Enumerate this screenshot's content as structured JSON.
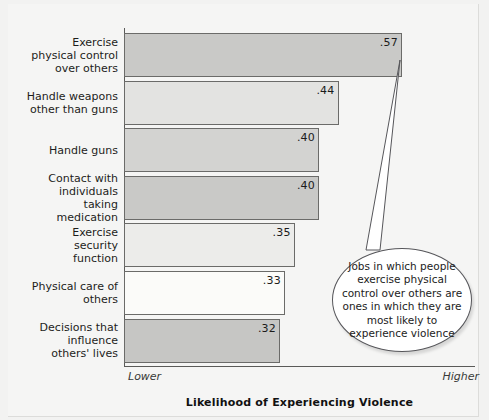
{
  "chart_data": {
    "type": "bar",
    "orientation": "horizontal",
    "title": "",
    "xlabel": "Likelihood of Experiencing Violence",
    "ylabel": "Characteristics of Jobs",
    "categories": [
      "Exercise physical control over others",
      "Handle weapons other than guns",
      "Handle guns",
      "Contact with individuals taking medication",
      "Exercise security function",
      "Physical care of others",
      "Decisions that influence others' lives"
    ],
    "values": [
      0.57,
      0.44,
      0.4,
      0.4,
      0.35,
      0.33,
      0.32
    ],
    "value_labels": [
      ".57",
      ".44",
      ".40",
      ".40",
      ".35",
      ".33",
      ".32"
    ],
    "bar_colors": [
      "#c9c9c7",
      "#e3e3e1",
      "#d3d3d1",
      "#c9c9c7",
      "#ececea",
      "#fbfbf9",
      "#c6c6c4"
    ],
    "bar_border_color": "#6b6b69",
    "xlim": [
      0,
      0.72
    ],
    "x_tick_labels": [
      "Lower",
      "Higher"
    ],
    "grid": false,
    "legend": false
  },
  "axis": {
    "y_title": "Characteristics of Jobs",
    "x_title": "Likelihood of Experiencing Violence",
    "x_low_label": "Lower",
    "x_high_label": "Higher"
  },
  "callout": {
    "text": "Jobs in which people exercise physical control over others are ones in which they are most likely to experience violence"
  }
}
